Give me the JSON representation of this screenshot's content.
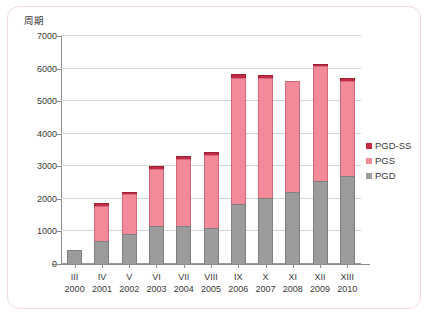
{
  "chart_data": {
    "type": "bar",
    "subtype": "stacked-vertical",
    "title": "",
    "ylabel": "周期",
    "xlabel": "",
    "ylim": [
      0,
      7000
    ],
    "ytick_step": 1000,
    "yticks": [
      0,
      1000,
      2000,
      3000,
      4000,
      5000,
      6000,
      7000
    ],
    "ytick_labels": [
      "0",
      "1000",
      "2000",
      "3000",
      "4000",
      "5000",
      "6000",
      "7000"
    ],
    "grid": true,
    "grid_axis": "y",
    "legend_position": "right",
    "categories": [
      "III",
      "IV",
      "V",
      "VI",
      "VII",
      "VIII",
      "IX",
      "X",
      "XI",
      "XII",
      "XIII"
    ],
    "category_sublabels": [
      "2000",
      "2001",
      "2002",
      "2003",
      "2004",
      "2005",
      "2006",
      "2007",
      "2008",
      "2009",
      "2010"
    ],
    "series": [
      {
        "name": "PGD",
        "color": "#9b9b9b",
        "values": [
          430,
          700,
          930,
          1160,
          1180,
          1120,
          1850,
          2030,
          2200,
          2550,
          2700
        ]
      },
      {
        "name": "PGS",
        "color": "#f4899a",
        "values": [
          0,
          1080,
          1210,
          1750,
          2050,
          2240,
          3870,
          3670,
          3420,
          3520,
          2930
        ]
      },
      {
        "name": "PGD-SS",
        "color": "#c62b45",
        "values": [
          0,
          80,
          80,
          90,
          100,
          90,
          100,
          110,
          0,
          60,
          80
        ]
      }
    ],
    "totals": [
      430,
      1860,
      2220,
      3000,
      3330,
      3450,
      5820,
      5810,
      5620,
      6130,
      5710
    ]
  },
  "legend": {
    "items": [
      {
        "label": "PGD-SS",
        "color": "#c62b45"
      },
      {
        "label": "PGS",
        "color": "#f4899a"
      },
      {
        "label": "PGD",
        "color": "#9b9b9b"
      }
    ]
  },
  "colors": {
    "frame_border": "#f2dada",
    "axis": "#8c8c8c",
    "gridline": "#d4d4d4",
    "text": "#3a3a3a",
    "background": "#ffffff"
  }
}
